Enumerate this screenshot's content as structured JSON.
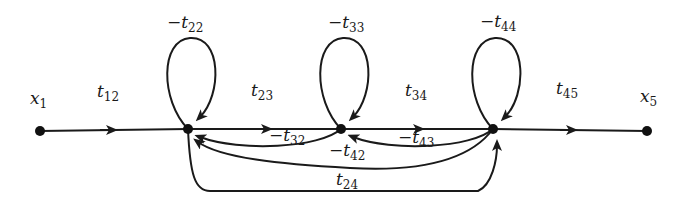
{
  "diagram": {
    "type": "signal-flow-graph",
    "colors": {
      "stroke": "#1a1a1a",
      "node": "#111111",
      "background": "#ffffff"
    },
    "nodes": [
      {
        "id": "x1",
        "label": {
          "base": "x",
          "sub": "1"
        }
      },
      {
        "id": "n2"
      },
      {
        "id": "n3"
      },
      {
        "id": "n4"
      },
      {
        "id": "x5",
        "label": {
          "base": "x",
          "sub": "5"
        }
      }
    ],
    "edges": [
      {
        "from": "x1",
        "to": "n2",
        "label": {
          "sign": "",
          "base": "t",
          "sub": "12"
        }
      },
      {
        "from": "n2",
        "to": "n2",
        "label": {
          "sign": "−",
          "base": "t",
          "sub": "22"
        }
      },
      {
        "from": "n2",
        "to": "n3",
        "label": {
          "sign": "",
          "base": "t",
          "sub": "23"
        }
      },
      {
        "from": "n3",
        "to": "n3",
        "label": {
          "sign": "−",
          "base": "t",
          "sub": "33"
        }
      },
      {
        "from": "n3",
        "to": "n4",
        "label": {
          "sign": "",
          "base": "t",
          "sub": "34"
        }
      },
      {
        "from": "n4",
        "to": "n4",
        "label": {
          "sign": "−",
          "base": "t",
          "sub": "44"
        }
      },
      {
        "from": "n4",
        "to": "x5",
        "label": {
          "sign": "",
          "base": "t",
          "sub": "45"
        }
      },
      {
        "from": "n3",
        "to": "n2",
        "label": {
          "sign": "−",
          "base": "t",
          "sub": "32"
        }
      },
      {
        "from": "n4",
        "to": "n3",
        "label": {
          "sign": "−",
          "base": "t",
          "sub": "43"
        }
      },
      {
        "from": "n4",
        "to": "n2",
        "label": {
          "sign": "−",
          "base": "t",
          "sub": "42"
        }
      },
      {
        "from": "n2",
        "to": "n4",
        "label": {
          "sign": "",
          "base": "t",
          "sub": "24"
        }
      }
    ]
  }
}
